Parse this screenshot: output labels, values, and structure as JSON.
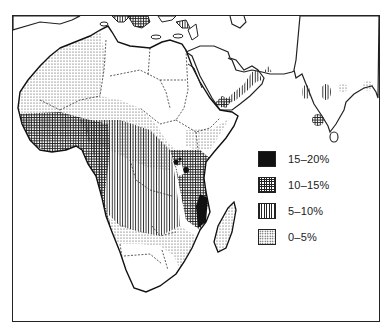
{
  "map": {
    "region": "Africa, Middle East and South Asia",
    "legend": {
      "items": [
        {
          "label": "15–20%",
          "pattern": "solid-black",
          "color": "#111111"
        },
        {
          "label": "10–15%",
          "pattern": "crosshatch",
          "color": "#222222"
        },
        {
          "label": "5–10%",
          "pattern": "vertical-lines",
          "color": "#222222"
        },
        {
          "label": "0–5%",
          "pattern": "dots",
          "color": "#333333"
        }
      ]
    },
    "colors": {
      "ink": "#222222",
      "background": "#ffffff"
    }
  }
}
